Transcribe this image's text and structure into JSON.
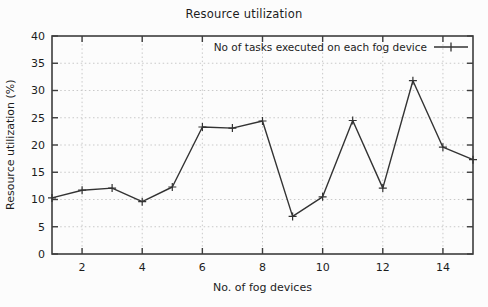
{
  "chart_data": {
    "type": "line",
    "title": "Resource utilization",
    "xlabel": "No. of fog devices",
    "ylabel": "Resource utilization (%)",
    "legend_label": "No of tasks executed on each fog device",
    "x": [
      1,
      2,
      3,
      4,
      5,
      6,
      7,
      8,
      9,
      10,
      11,
      12,
      13,
      14,
      15
    ],
    "series": [
      {
        "name": "No of tasks executed on each fog device",
        "marker": "plus",
        "values": [
          10.3,
          11.7,
          12.1,
          9.6,
          12.3,
          23.3,
          23.1,
          24.4,
          6.9,
          10.5,
          24.5,
          12.1,
          31.8,
          19.6,
          17.3
        ]
      }
    ],
    "xlim": [
      1,
      15
    ],
    "ylim": [
      0,
      40
    ],
    "xticks": [
      2,
      4,
      6,
      8,
      10,
      12,
      14
    ],
    "yticks": [
      0,
      5,
      10,
      15,
      20,
      25,
      30,
      35,
      40
    ],
    "grid": "dotted",
    "legend_position": "top-right-inside",
    "colors": {
      "line": "#333333",
      "grid": "#c9c9c9",
      "axis": "#3d3d3d",
      "text": "#1c1c1c",
      "background": "#fcfcfc"
    }
  }
}
